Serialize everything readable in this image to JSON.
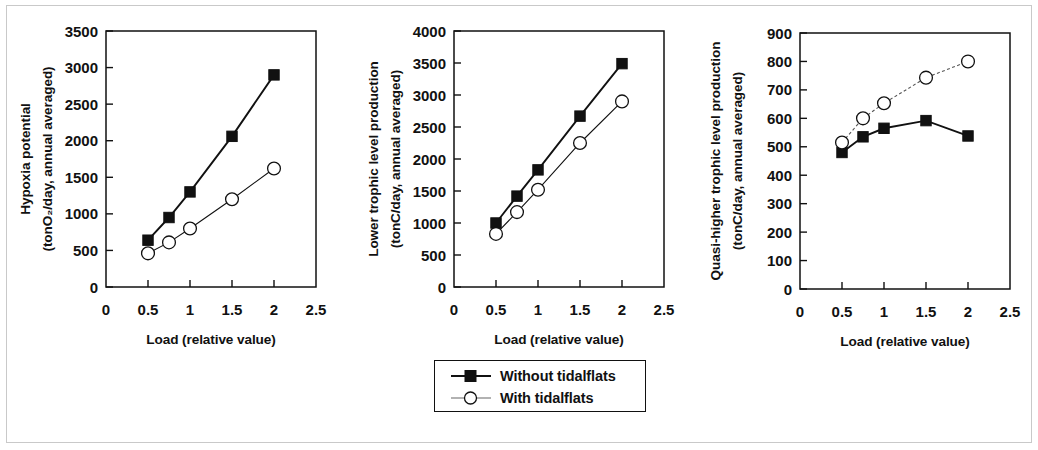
{
  "figure": {
    "x_axis_title": "Load (relative value)",
    "x_ticks": [
      "0",
      "0.5",
      "1",
      "1.5",
      "2",
      "2.5"
    ]
  },
  "legend": {
    "items": [
      {
        "label": "Without tidalflats",
        "marker": "filled-square",
        "line": "solid",
        "color": "#111111"
      },
      {
        "label": "With tidalflats",
        "marker": "open-circle",
        "line": "thin",
        "color": "#111111"
      }
    ]
  },
  "chart_data": [
    {
      "type": "line",
      "title": "",
      "ylabel_line1": "Hypoxia potential",
      "ylabel_line2": "(tonO₂/day, annual averaged)",
      "ylabel": "Hypoxia potential (tonO₂/day, annual averaged)",
      "xlabel": "Load (relative value)",
      "x": [
        0.5,
        0.75,
        1,
        1.5,
        2
      ],
      "xlim": [
        0,
        2.5
      ],
      "ylim": [
        0,
        3500
      ],
      "yticks": [
        0,
        500,
        1000,
        1500,
        2000,
        2500,
        3000,
        3500
      ],
      "xticks": [
        0,
        0.5,
        1,
        1.5,
        2,
        2.5
      ],
      "grid": false,
      "legend_position": "below-figure",
      "series": [
        {
          "name": "Without tidalflats",
          "values": [
            640,
            950,
            1300,
            2060,
            2900
          ]
        },
        {
          "name": "With tidalflats",
          "values": [
            460,
            610,
            800,
            1200,
            1620
          ]
        }
      ]
    },
    {
      "type": "line",
      "title": "",
      "ylabel_line1": "Lower trophic level production",
      "ylabel_line2": "(tonC/day, annual averaged)",
      "ylabel": "Lower trophic level production (tonC/day, annual averaged)",
      "xlabel": "Load (relative value)",
      "x": [
        0.5,
        0.75,
        1,
        1.5,
        2
      ],
      "xlim": [
        0,
        2.5
      ],
      "ylim": [
        0,
        4000
      ],
      "yticks": [
        0,
        500,
        1000,
        1500,
        2000,
        2500,
        3000,
        3500,
        4000
      ],
      "xticks": [
        0,
        0.5,
        1,
        1.5,
        2,
        2.5
      ],
      "grid": false,
      "legend_position": "below-figure",
      "series": [
        {
          "name": "Without tidalflats",
          "values": [
            1000,
            1420,
            1830,
            2670,
            3490
          ]
        },
        {
          "name": "With tidalflats",
          "values": [
            830,
            1170,
            1520,
            2250,
            2900
          ]
        }
      ]
    },
    {
      "type": "line",
      "title": "",
      "ylabel_line1": "Quasi-higher trophic level production",
      "ylabel_line2": "(tonC/day, annual averaged)",
      "ylabel": "Quasi-higher trophic level production (tonC/day, annual averaged)",
      "xlabel": "Load (relative value)",
      "x": [
        0.5,
        0.75,
        1,
        1.5,
        2
      ],
      "xlim": [
        0,
        2.5
      ],
      "ylim": [
        0,
        900
      ],
      "yticks": [
        0,
        100,
        200,
        300,
        400,
        500,
        600,
        700,
        800,
        900
      ],
      "xticks": [
        0,
        0.5,
        1,
        1.5,
        2,
        2.5
      ],
      "grid": false,
      "legend_position": "below-figure",
      "series": [
        {
          "name": "Without tidalflats",
          "values": [
            480,
            535,
            565,
            592,
            538
          ]
        },
        {
          "name": "With tidalflats",
          "values": [
            515,
            600,
            653,
            743,
            800
          ]
        }
      ]
    }
  ]
}
